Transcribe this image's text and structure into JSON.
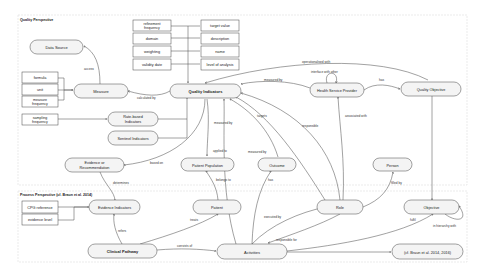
{
  "perspectives": {
    "quality": "Quality Perspective",
    "process": "Process Perspective (cf. Braun et al. 2014)"
  },
  "nodes": {
    "data_source": "Data Source",
    "measure": "Measure",
    "quality_indicators": "Quality Indicators",
    "rate_based_1": "Rate-based",
    "rate_based_2": "Indicators",
    "sentinel": "Sentinel Indicators",
    "evidence_rec_1": "Evidence or",
    "evidence_rec_2": "Recommendation",
    "patient_population": "Patient Population",
    "outcome": "Outcome",
    "person": "Person",
    "health_service_provider": "Health Service Provider",
    "quality_objective": "Quality Objective",
    "evidence_indicators": "Evidence Indicators",
    "patient": "Patient",
    "role": "Role",
    "objective": "Objective",
    "clinical_pathway": "Clinical Pathway",
    "activities": "Activities",
    "braun_ref": "(cf. Braun et al. 2014, 2016)"
  },
  "attribute_boxes": {
    "qi_left": [
      "refinement frequency",
      "domain",
      "weighting",
      "validity date"
    ],
    "qi_right": [
      "target value",
      "description",
      "name",
      "level of analysis"
    ],
    "measure": [
      "formula",
      "unit",
      "measure frequency"
    ],
    "rate": [
      "sampling frequency"
    ],
    "evidence": [
      "CPG reference",
      "evidence level"
    ]
  },
  "edge_labels": {
    "access": "access",
    "calculated_by": "calculated by",
    "operationalised_with": "operationalised with",
    "interface_with_other": "interface with other",
    "measured_by_hsp": "measured by",
    "has_qo": "has",
    "measured_by_outcome": "measured by",
    "targets": "targets",
    "responsible": "responsible",
    "associated_with": "associated with",
    "applied_to": "applied to",
    "measured_by_low": "measured by",
    "based_on": "based on",
    "determines": "determines",
    "belongs_to": "belongs to",
    "has_outcome": "has",
    "filled_by": "filled by",
    "treats": "treats",
    "executed_by": "executed by",
    "refers": "refers",
    "consists_of": "consists of",
    "responsible_for": "responsible for",
    "fulfil": "fulfil",
    "in_hierarchy_with": "in hierarchy with"
  }
}
